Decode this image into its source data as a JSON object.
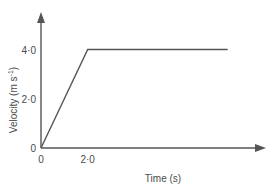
{
  "chart_data": {
    "type": "line",
    "title": "",
    "subtitle": "",
    "xlabel": "Time (s)",
    "ylabel": "Velocity (m s",
    "ylabel_superscript": "-1",
    "ylabel_suffix": ")",
    "x": [
      0,
      2.0,
      8.0
    ],
    "values": [
      0,
      4.0,
      4.0
    ],
    "series": [
      {
        "name": "velocity",
        "points": [
          {
            "x": 0,
            "y": 0
          },
          {
            "x": 2.0,
            "y": 4.0
          },
          {
            "x": 8.0,
            "y": 4.0
          }
        ]
      }
    ],
    "xticks": [
      {
        "value": 0,
        "label": "0"
      },
      {
        "value": 2.0,
        "label": "2·0"
      }
    ],
    "yticks": [
      {
        "value": 0,
        "label": "0"
      },
      {
        "value": 2.0,
        "label": "2·0"
      },
      {
        "value": 4.0,
        "label": "4·0"
      }
    ],
    "xlim": [
      0,
      9.3
    ],
    "ylim": [
      0,
      5.2
    ],
    "grid": false,
    "legend": false,
    "legend_position": "none",
    "line_color": "#555555",
    "axis_color": "#555555",
    "text_color": "#4a4a4a",
    "background_color": "#ffffff",
    "annotations": []
  }
}
